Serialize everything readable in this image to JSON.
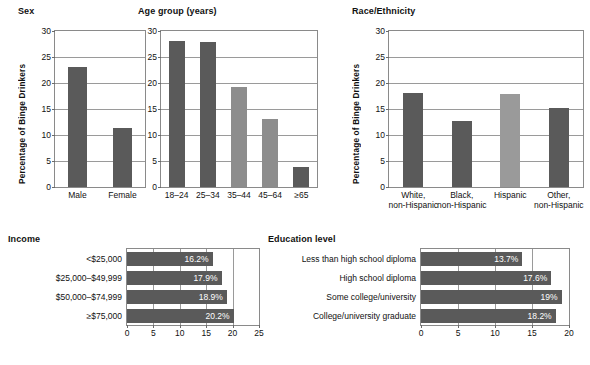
{
  "figure": {
    "axis_title_y": "Percentage of Binge Drinkers"
  },
  "chart_data": [
    {
      "id": "sex",
      "type": "bar",
      "orientation": "vertical",
      "title": "Sex",
      "xlabel": "",
      "ylabel": "Percentage of Binge Drinkers",
      "ylim": [
        0,
        30
      ],
      "yticks": [
        0,
        5,
        10,
        15,
        20,
        25,
        30
      ],
      "grid": true,
      "categories": [
        "Male",
        "Female"
      ],
      "values": [
        23.1,
        11.3
      ],
      "colors": [
        "#5a5a5a",
        "#5a5a5a"
      ]
    },
    {
      "id": "age-group",
      "type": "bar",
      "orientation": "vertical",
      "title": "Age group (years)",
      "xlabel": "",
      "ylabel": "Percentage of Binge Drinkers",
      "ylim": [
        0,
        30
      ],
      "yticks": [
        0,
        5,
        10,
        15,
        20,
        25,
        30
      ],
      "grid": true,
      "categories": [
        "18–24",
        "25–34",
        "35–44",
        "45–64",
        "≥65"
      ],
      "values": [
        28.0,
        27.8,
        19.3,
        13.1,
        3.8
      ],
      "colors": [
        "#5a5a5a",
        "#5a5a5a",
        "#8d8d8d",
        "#8d8d8d",
        "#5a5a5a"
      ]
    },
    {
      "id": "race-ethnicity",
      "type": "bar",
      "orientation": "vertical",
      "title": "Race/Ethnicity",
      "xlabel": "",
      "ylabel": "Percentage of Binge Drinkers",
      "ylim": [
        0,
        30
      ],
      "yticks": [
        0,
        5,
        10,
        15,
        20,
        25,
        30
      ],
      "grid": true,
      "categories": [
        "White,\nnon-Hispanic",
        "Black,\nnon-Hispanic",
        "Hispanic",
        "Other,\nnon-Hispanic"
      ],
      "values": [
        18.0,
        12.6,
        17.9,
        15.2
      ],
      "colors": [
        "#5a5a5a",
        "#5a5a5a",
        "#9a9a9a",
        "#5a5a5a"
      ]
    },
    {
      "id": "income",
      "type": "bar",
      "orientation": "horizontal",
      "title": "Income",
      "xlabel": "",
      "ylabel": "",
      "xlim": [
        0,
        25
      ],
      "xticks": [
        0,
        5,
        10,
        15,
        20,
        25
      ],
      "grid": true,
      "categories": [
        "<$25,000",
        "$25,000–$49,999",
        "$50,000–$74,999",
        "≥$75,000"
      ],
      "values": [
        16.2,
        17.9,
        18.9,
        20.2
      ],
      "labels": [
        "16.2%",
        "17.9%",
        "18.9%",
        "20.2%"
      ],
      "colors": [
        "#5a5a5a",
        "#5a5a5a",
        "#5a5a5a",
        "#5a5a5a"
      ]
    },
    {
      "id": "education-level",
      "type": "bar",
      "orientation": "horizontal",
      "title": "Education level",
      "xlabel": "",
      "ylabel": "",
      "xlim": [
        0,
        20
      ],
      "xticks": [
        0,
        5,
        10,
        15,
        20
      ],
      "grid": true,
      "categories": [
        "Less than high school diploma",
        "High school diploma",
        "Some college/university",
        "College/university graduate"
      ],
      "values": [
        13.7,
        17.6,
        19.0,
        18.2
      ],
      "labels": [
        "13.7%",
        "17.6%",
        "19%",
        "18.2%"
      ],
      "colors": [
        "#5a5a5a",
        "#5a5a5a",
        "#5a5a5a",
        "#5a5a5a"
      ]
    }
  ]
}
